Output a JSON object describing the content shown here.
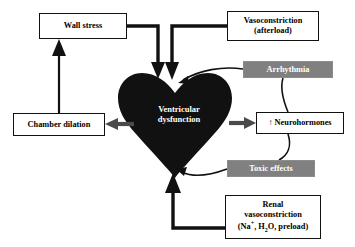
{
  "diagram": {
    "background_color": "#ffffff",
    "colors": {
      "heart_fill": "#111111",
      "gray_box_fill": "#808080",
      "gray_arrow": "#4a4a4a",
      "black_arrow": "#111111",
      "box_border": "#111111",
      "box_fill": "#ffffff",
      "white_text": "#ffffff"
    },
    "nodes": {
      "wall_stress": {
        "label": "Wall stress",
        "style": "white-box"
      },
      "vasoconstriction": {
        "line1": "Vasoconstriction",
        "line2": "(afterload)",
        "style": "white-box"
      },
      "arrhythmia": {
        "label": "Arrhythmia",
        "style": "gray-box"
      },
      "neurohormones": {
        "label": "↑ Neurohormones",
        "style": "white-box"
      },
      "toxic_effects": {
        "label": "Toxic effects",
        "style": "gray-box"
      },
      "renal": {
        "line1": "Renal",
        "line2": "vasoconstriction",
        "line3_prefix": "(Na",
        "line3_sup": "+",
        "line3_mid": ", H",
        "line3_sub": "2",
        "line3_suffix": "O, preload)",
        "style": "white-box"
      },
      "chamber_dilation": {
        "label": "Chamber dilation",
        "style": "white-box"
      },
      "heart": {
        "line1": "Ventricular",
        "line2": "dysfunction",
        "style": "black-heart"
      }
    },
    "edges": [
      {
        "name": "wall-stress-to-heart",
        "from": "wall_stress",
        "to": "heart",
        "style": "thick-black-elbow"
      },
      {
        "name": "vasoconstriction-to-heart",
        "from": "vasoconstriction",
        "to": "heart",
        "style": "thick-black-elbow"
      },
      {
        "name": "arrhythmia-to-heart",
        "from": "arrhythmia",
        "to": "heart",
        "style": "thin-black-curve"
      },
      {
        "name": "heart-to-neurohormones",
        "from": "heart",
        "to": "neurohormones",
        "style": "gray-arrow"
      },
      {
        "name": "neurohormones-to-arrhythmia",
        "from": "neurohormones",
        "to": "arrhythmia",
        "style": "thin-black-curve"
      },
      {
        "name": "neurohormones-to-toxic-effects",
        "from": "neurohormones",
        "to": "toxic_effects",
        "style": "thin-black-curve"
      },
      {
        "name": "toxic-effects-to-heart",
        "from": "toxic_effects",
        "to": "heart",
        "style": "thin-black-curve"
      },
      {
        "name": "renal-to-heart",
        "from": "renal",
        "to": "heart",
        "style": "thick-black-elbow"
      },
      {
        "name": "heart-to-chamber-dilation",
        "from": "heart",
        "to": "chamber_dilation",
        "style": "gray-arrow"
      },
      {
        "name": "chamber-dilation-to-wall-stress",
        "from": "chamber_dilation",
        "to": "wall_stress",
        "style": "thin-black-arrow"
      }
    ]
  }
}
